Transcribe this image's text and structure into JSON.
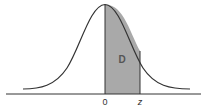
{
  "diagram": {
    "type": "normal-distribution-curve",
    "shaded_region_label": "D",
    "axis_labels": {
      "origin": "0",
      "z": "z"
    },
    "colors": {
      "curve": "#333333",
      "shade": "#a9a9a9",
      "axis": "#333333",
      "background": "#ffffff"
    }
  }
}
